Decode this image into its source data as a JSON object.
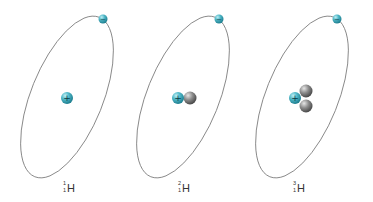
{
  "colors": {
    "proton": "#4fb8c8",
    "electron": "#4fb8c8",
    "neutron": "#8c8c8c",
    "orbit": "#7a7a7a",
    "label": "#333333"
  },
  "symbols": {
    "proton": "+",
    "electron": "−"
  },
  "atoms": [
    {
      "name": "protium",
      "mass_number": "1",
      "atomic_number": "1",
      "element": "H",
      "protons": 1,
      "neutrons": 0,
      "electrons": 1
    },
    {
      "name": "deuterium",
      "mass_number": "2",
      "atomic_number": "1",
      "element": "H",
      "protons": 1,
      "neutrons": 1,
      "electrons": 1
    },
    {
      "name": "tritium",
      "mass_number": "3",
      "atomic_number": "1",
      "element": "H",
      "protons": 1,
      "neutrons": 2,
      "electrons": 1
    }
  ]
}
